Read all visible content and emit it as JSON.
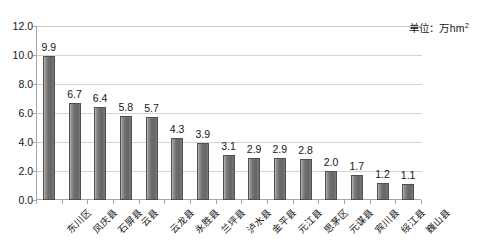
{
  "chart_data": {
    "type": "bar",
    "title": "",
    "subtitle": "",
    "xlabel": "",
    "ylabel": "",
    "unit_note": "单位：万hm",
    "unit_note_sup": "2",
    "ylim": [
      0.0,
      12.0
    ],
    "ytick_step": 2.0,
    "ytick_labels": [
      "12.0",
      "10.0",
      "8.0",
      "6.0",
      "4.0",
      "2.0",
      "0.0"
    ],
    "ytick_values": [
      12.0,
      10.0,
      8.0,
      6.0,
      4.0,
      2.0,
      0.0
    ],
    "grid": "horizontal",
    "legend": "none",
    "categories": [
      "东川区",
      "凤庆县",
      "石屏县",
      "云县",
      "云龙县",
      "永胜县",
      "兰坪县",
      "泸水县",
      "金平县",
      "元江县",
      "思茅区",
      "元谋县",
      "宾川县",
      "绥江县",
      "巍山县"
    ],
    "values": [
      9.9,
      6.7,
      6.4,
      5.8,
      5.7,
      4.3,
      3.9,
      3.1,
      2.9,
      2.9,
      2.8,
      2.0,
      1.7,
      1.2,
      1.1
    ],
    "value_labels": [
      "9.9",
      "6.7",
      "6.4",
      "5.8",
      "5.7",
      "4.3",
      "3.9",
      "3.1",
      "2.9",
      "2.9",
      "2.8",
      "2.0",
      "1.7",
      "1.2",
      "1.1"
    ],
    "colors": {
      "bar_fill_light": "#bdbdbd",
      "bar_fill_dark": "#666666",
      "bar_border": "#4f4f4f",
      "gridline": "#d3d3d3",
      "axis": "#a6a6a6",
      "text": "#161616",
      "background": "#ffffff"
    }
  }
}
